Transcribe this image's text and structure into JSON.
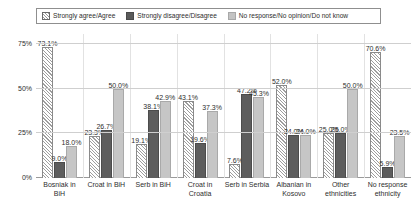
{
  "legend": {
    "position": "top",
    "items": [
      {
        "label": "Strongly agree/Agree",
        "swatch": "hatch-diagonal",
        "color": "#ffffff"
      },
      {
        "label": "Strongly disagree/Disagree",
        "swatch": "solid-dark",
        "color": "#5d5d5d"
      },
      {
        "label": "No response/No opinion/Do not know",
        "swatch": "solid-light",
        "color": "#c6c6c6"
      }
    ]
  },
  "axis": {
    "yticks": [
      "0%",
      "25%",
      "50%",
      "75%"
    ]
  },
  "chart_data": {
    "type": "bar",
    "title": "",
    "xlabel": "",
    "ylabel": "",
    "ylim": [
      0,
      75
    ],
    "grid": true,
    "legend_position": "top",
    "categories": [
      "Bosniak in BiH",
      "Croat in BiH",
      "Serb in BiH",
      "Croat in Croatia",
      "Serb in Serbia",
      "Albanian in Kosovo",
      "Other ethnicities",
      "No response ethnicity"
    ],
    "series": [
      {
        "name": "Strongly agree/Agree",
        "values": [
          73.1,
          23.3,
          19.1,
          43.1,
          7.6,
          52.0,
          25.0,
          70.6
        ],
        "labels": [
          "73.1%",
          "23.3%",
          "19.1%",
          "43.1%",
          "7.6%",
          "52.0%",
          "25.0%",
          "70.6%"
        ]
      },
      {
        "name": "Strongly disagree/Disagree",
        "values": [
          9.0,
          26.7,
          38.1,
          19.6,
          47.2,
          24.0,
          25.0,
          5.9
        ],
        "labels": [
          "9.0%",
          "26.7%",
          "38.1%",
          "19.6%",
          "47.2%",
          "24.0%",
          "25.0%",
          "5.9%"
        ]
      },
      {
        "name": "No response/No opinion/Do not know",
        "values": [
          18.0,
          50.0,
          42.9,
          37.3,
          45.3,
          24.0,
          50.0,
          23.5
        ],
        "labels": [
          "18.0%",
          "50.0%",
          "42.9%",
          "37.3%",
          "45.3%",
          "24.0%",
          "50.0%",
          "23.5%"
        ]
      }
    ]
  }
}
